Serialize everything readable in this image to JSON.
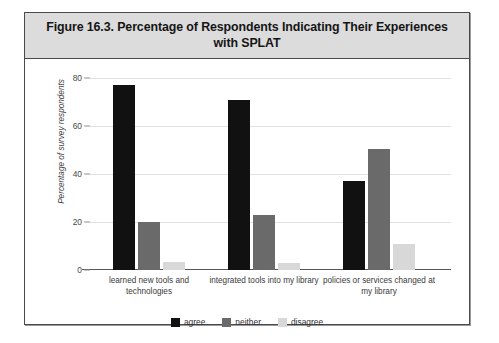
{
  "figure": {
    "title": "Figure 16.3. Percentage of Respondents Indicating Their Experiences with SPLAT"
  },
  "chart_data": {
    "type": "bar",
    "title": "Figure 16.3. Percentage of Respondents Indicating Their Experiences with SPLAT",
    "xlabel": "",
    "ylabel": "Percentage of survey respondents",
    "ylim": [
      0,
      80
    ],
    "yticks": [
      0,
      20,
      40,
      60,
      80
    ],
    "ytick_labels": [
      "0",
      "20",
      "40",
      "60",
      "80"
    ],
    "grid": true,
    "legend_position": "bottom",
    "categories": [
      "learned new tools and technologies",
      "integrated tools into my library",
      "policies or services changed at my library"
    ],
    "series": [
      {
        "name": "agree",
        "color": "#111111",
        "values": [
          77,
          71,
          37
        ]
      },
      {
        "name": "neither",
        "color": "#6a6a6a",
        "values": [
          20,
          23,
          50.5
        ]
      },
      {
        "name": "disagree",
        "color": "#d8d8d8",
        "values": [
          3.5,
          3,
          11
        ]
      }
    ]
  },
  "legend": {
    "items": [
      {
        "label": "agree"
      },
      {
        "label": "neither"
      },
      {
        "label": "disagree"
      }
    ]
  }
}
